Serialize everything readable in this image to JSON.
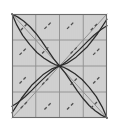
{
  "figure": {
    "title": "",
    "background_color": "#ffffff",
    "plot_background_color": "#d2d2d2",
    "border_color": "#6b6b6b",
    "grid_color": "#8f8f8f",
    "curve_color": "#2b2b2b",
    "separatrix_color": "#8a8a8a",
    "dash_color": "#4f4f4f",
    "plot_box": {
      "x": 12,
      "y": 14,
      "width": 95,
      "height": 104
    }
  },
  "chart_data": {
    "type": "line",
    "title": "",
    "subtitle": "",
    "xlabel": "",
    "ylabel": "",
    "xlim": [
      -2,
      2
    ],
    "ylim": [
      -2,
      2
    ],
    "grid": true,
    "legend_position": "none",
    "xticks": [
      -2,
      -1,
      0,
      1,
      2
    ],
    "yticks": [
      -2,
      -1,
      0,
      1,
      2
    ],
    "xticklabels": [
      "",
      "",
      "",
      "",
      ""
    ],
    "yticklabels": [
      "",
      "",
      "",
      "",
      ""
    ],
    "annotations": [
      {
        "label": "equilibrium-node",
        "x": 0,
        "y": 0
      }
    ],
    "series": [
      {
        "name": "separatrix-antidiagonal",
        "style": "solid-straight",
        "color": "#8a8a8a",
        "x": [
          -2,
          2
        ],
        "y": [
          2,
          -2
        ]
      },
      {
        "name": "separatrix-diagonal",
        "style": "solid-straight",
        "color": "#8a8a8a",
        "x": [
          -2,
          2
        ],
        "y": [
          -2,
          2
        ]
      },
      {
        "name": "trajectory-upper-left-arc",
        "style": "solid-curve",
        "color": "#2b2b2b",
        "x": [
          -2.0,
          -1.75,
          -1.5,
          -1.25,
          -1.0,
          -0.75,
          -0.5,
          -0.25,
          0.0
        ],
        "y": [
          2.0,
          1.88,
          1.72,
          1.52,
          1.26,
          0.96,
          0.62,
          0.28,
          0.0
        ]
      },
      {
        "name": "trajectory-upper-left-steep",
        "style": "solid-curve",
        "color": "#2b2b2b",
        "x": [
          -2.0,
          -1.8,
          -1.55,
          -1.25,
          -0.95,
          -0.65,
          -0.35,
          -0.15,
          0.0
        ],
        "y": [
          2.0,
          1.58,
          1.18,
          0.82,
          0.52,
          0.3,
          0.13,
          0.04,
          0.0
        ]
      },
      {
        "name": "trajectory-lower-right-arc",
        "style": "solid-curve",
        "color": "#2b2b2b",
        "x": [
          2.0,
          1.75,
          1.5,
          1.25,
          1.0,
          0.75,
          0.5,
          0.25,
          0.0
        ],
        "y": [
          -2.0,
          -1.88,
          -1.72,
          -1.52,
          -1.26,
          -0.96,
          -0.62,
          -0.28,
          0.0
        ]
      },
      {
        "name": "trajectory-lower-right-steep",
        "style": "solid-curve",
        "color": "#2b2b2b",
        "x": [
          2.0,
          1.8,
          1.55,
          1.25,
          0.95,
          0.65,
          0.35,
          0.15,
          0.0
        ],
        "y": [
          -2.0,
          -1.58,
          -1.18,
          -0.82,
          -0.52,
          -0.3,
          -0.13,
          -0.04,
          0.0
        ]
      },
      {
        "name": "trajectory-lower-left-arc",
        "style": "solid-curve",
        "color": "#2b2b2b",
        "x": [
          -2.0,
          -1.75,
          -1.45,
          -1.15,
          -0.85,
          -0.55,
          -0.3,
          -0.12,
          0.0
        ],
        "y": [
          -1.55,
          -1.4,
          -1.18,
          -0.92,
          -0.64,
          -0.38,
          -0.18,
          -0.06,
          0.0
        ]
      },
      {
        "name": "trajectory-upper-right-arc",
        "style": "solid-curve",
        "color": "#2b2b2b",
        "x": [
          2.0,
          1.75,
          1.45,
          1.15,
          0.85,
          0.55,
          0.3,
          0.12,
          0.0
        ],
        "y": [
          1.55,
          1.4,
          1.18,
          0.92,
          0.64,
          0.38,
          0.18,
          0.06,
          0.0
        ]
      },
      {
        "name": "trajectory-center-fan-upper",
        "style": "solid-curve",
        "color": "#2b2b2b",
        "x": [
          0.0,
          0.3,
          0.7,
          1.15,
          1.6,
          2.0
        ],
        "y": [
          0.0,
          0.1,
          0.34,
          0.72,
          1.24,
          1.8
        ]
      },
      {
        "name": "trajectory-center-fan-lower",
        "style": "solid-curve",
        "color": "#2b2b2b",
        "x": [
          0.0,
          -0.3,
          -0.7,
          -1.15,
          -1.6,
          -2.0
        ],
        "y": [
          0.0,
          -0.1,
          -0.34,
          -0.72,
          -1.24,
          -1.8
        ]
      }
    ],
    "direction_field": {
      "name": "dashed-slope-marks",
      "style": "dashed",
      "color": "#4f4f4f",
      "marks": [
        {
          "x": -1.5,
          "y": 1.5,
          "angle_deg": 45
        },
        {
          "x": -0.5,
          "y": 1.55,
          "angle_deg": 45
        },
        {
          "x": 0.45,
          "y": 1.55,
          "angle_deg": 45
        },
        {
          "x": 1.45,
          "y": 1.5,
          "angle_deg": 45
        },
        {
          "x": -1.55,
          "y": 0.55,
          "angle_deg": 45
        },
        {
          "x": -0.6,
          "y": 0.6,
          "angle_deg": 45
        },
        {
          "x": 0.6,
          "y": 0.6,
          "angle_deg": 45
        },
        {
          "x": 1.55,
          "y": 0.55,
          "angle_deg": 45
        },
        {
          "x": -1.55,
          "y": -0.55,
          "angle_deg": 45
        },
        {
          "x": -0.6,
          "y": -0.6,
          "angle_deg": 45
        },
        {
          "x": 0.6,
          "y": -0.6,
          "angle_deg": 45
        },
        {
          "x": 1.55,
          "y": -0.55,
          "angle_deg": 45
        },
        {
          "x": -1.5,
          "y": -1.5,
          "angle_deg": 45
        },
        {
          "x": -0.5,
          "y": -1.55,
          "angle_deg": 45
        },
        {
          "x": 0.45,
          "y": -1.55,
          "angle_deg": 45
        },
        {
          "x": 1.45,
          "y": -1.5,
          "angle_deg": 45
        }
      ]
    }
  }
}
